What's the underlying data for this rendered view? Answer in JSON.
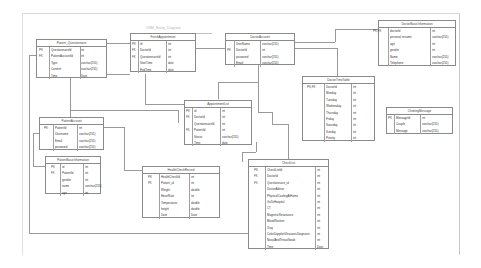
{
  "diagram": {
    "title": "OSM_Entity_Diagram"
  },
  "entities": {
    "patient_questionnaire": {
      "name": "Patient_Questionnaire",
      "rows": [
        {
          "key": "PK",
          "field": "QuestionnaireId",
          "type": "int"
        },
        {
          "key": "FK",
          "field": "PatientAccountId",
          "type": "int"
        },
        {
          "key": "",
          "field": "Type",
          "type": "varchar(255)"
        },
        {
          "key": "",
          "field": "Content",
          "type": "varchar(255)"
        },
        {
          "key": "",
          "field": "Time",
          "type": "Date"
        }
      ]
    },
    "finish_appointment": {
      "name": "FinishAppointment",
      "rows": [
        {
          "key": "PK",
          "field": "id",
          "type": "int"
        },
        {
          "key": "FK",
          "field": "DoctorId",
          "type": "int"
        },
        {
          "key": "FK",
          "field": "QuestionnaireId",
          "type": "int"
        },
        {
          "key": "",
          "field": "StartTime",
          "type": "date"
        },
        {
          "key": "",
          "field": "EndTime",
          "type": "date"
        }
      ]
    },
    "doctor_account": {
      "name": "DoctorAccount",
      "rows": [
        {
          "key": "",
          "field": "UserName",
          "type": "varchar(255)"
        },
        {
          "key": "PK",
          "field": "DoctorId",
          "type": "int"
        },
        {
          "key": "",
          "field": "password",
          "type": "varchar(255)"
        },
        {
          "key": "",
          "field": "Email",
          "type": "varchar(255)"
        }
      ]
    },
    "doctor_basic_information": {
      "name": "DoctorBasicInformation",
      "rows": [
        {
          "key": "PK,FK",
          "field": "doctorId",
          "type": "int"
        },
        {
          "key": "",
          "field": "personal resume",
          "type": "varchar(255)"
        },
        {
          "key": "",
          "field": "age",
          "type": "int"
        },
        {
          "key": "",
          "field": "gender",
          "type": "int"
        },
        {
          "key": "",
          "field": "Name",
          "type": "varchar(255)"
        },
        {
          "key": "",
          "field": "Telephone",
          "type": "varchar(255)"
        }
      ]
    },
    "doctor_time_table": {
      "name": "DoctorTimeTable",
      "rows": [
        {
          "key": "PK,FK",
          "field": "DoctorId",
          "type": "int"
        },
        {
          "key": "",
          "field": "Monday",
          "type": "int"
        },
        {
          "key": "",
          "field": "Tuesday",
          "type": "int"
        },
        {
          "key": "",
          "field": "Wednesday",
          "type": "int"
        },
        {
          "key": "",
          "field": "Thursday",
          "type": "int"
        },
        {
          "key": "",
          "field": "Friday",
          "type": "int"
        },
        {
          "key": "",
          "field": "Saturday",
          "type": "int"
        },
        {
          "key": "",
          "field": "Sunday",
          "type": "int"
        },
        {
          "key": "",
          "field": "Priority",
          "type": "int"
        }
      ]
    },
    "chatting_message": {
      "name": "ChattingMessage",
      "rows": [
        {
          "key": "PK",
          "field": "MessageId",
          "type": "int"
        },
        {
          "key": "",
          "field": "Couple",
          "type": "varchar(255)"
        },
        {
          "key": "",
          "field": "Message",
          "type": "varchar(255)"
        }
      ]
    },
    "appointment_list": {
      "name": "AppointmentList",
      "rows": [
        {
          "key": "PK",
          "field": "id",
          "type": "int"
        },
        {
          "key": "FK",
          "field": "DoctorId",
          "type": "int"
        },
        {
          "key": "",
          "field": "QuestionnaireId",
          "type": "int"
        },
        {
          "key": "FK",
          "field": "PatientId",
          "type": "int"
        },
        {
          "key": "",
          "field": "Status",
          "type": "varchar(255)"
        },
        {
          "key": "",
          "field": "Time",
          "type": "date"
        }
      ]
    },
    "patient_account": {
      "name": "PatientAccount",
      "rows": [
        {
          "key": "PK",
          "field": "PatientId",
          "type": "int"
        },
        {
          "key": "",
          "field": "Username",
          "type": "varchar(255)"
        },
        {
          "key": "",
          "field": "Email",
          "type": "varchar(255)"
        },
        {
          "key": "",
          "field": "password",
          "type": "varchar(255)"
        }
      ]
    },
    "patient_basic_information": {
      "name": "PatientBasicInformation",
      "rows": [
        {
          "key": "PK",
          "field": "id",
          "type": "int"
        },
        {
          "key": "FK",
          "field": "PatientId",
          "type": "int"
        },
        {
          "key": "",
          "field": "gender",
          "type": "int"
        },
        {
          "key": "",
          "field": "name",
          "type": "varchar(255)"
        },
        {
          "key": "",
          "field": "age",
          "type": "int"
        }
      ]
    },
    "health_check_record": {
      "name": "HealthCheckRecord",
      "rows": [
        {
          "key": "PK",
          "field": "HealthCheckId",
          "type": "int"
        },
        {
          "key": "FK",
          "field": "Patient_id",
          "type": "int"
        },
        {
          "key": "",
          "field": "Weight",
          "type": "double"
        },
        {
          "key": "",
          "field": "HeartRate",
          "type": "int"
        },
        {
          "key": "",
          "field": "Temperature",
          "type": "double"
        },
        {
          "key": "",
          "field": "height",
          "type": "double"
        },
        {
          "key": "",
          "field": "Date",
          "type": "Date"
        }
      ]
    },
    "check_list": {
      "name": "CheckList",
      "rows": [
        {
          "key": "PK",
          "field": "CheckListId",
          "type": "int"
        },
        {
          "key": "FK",
          "field": "DoctorId",
          "type": "int"
        },
        {
          "key": "FK",
          "field": "Questionnaire_id",
          "type": "int"
        },
        {
          "key": "",
          "field": "DoctorAdvise",
          "type": "int"
        },
        {
          "key": "",
          "field": "PhysicalCoolingAtHome",
          "type": "int"
        },
        {
          "key": "",
          "field": "GoToHospital",
          "type": "int"
        },
        {
          "key": "",
          "field": "CT",
          "type": "int"
        },
        {
          "key": "",
          "field": "MagneticResonance",
          "type": "int"
        },
        {
          "key": "",
          "field": "BloodRoutine",
          "type": "int"
        },
        {
          "key": "",
          "field": "Xray",
          "type": "int"
        },
        {
          "key": "",
          "field": "ColorDopplerUltrasonicDiagnosis",
          "type": "int"
        },
        {
          "key": "",
          "field": "NasalAndThroatSwab",
          "type": "int"
        },
        {
          "key": "",
          "field": "Time",
          "type": "Date"
        }
      ]
    }
  }
}
